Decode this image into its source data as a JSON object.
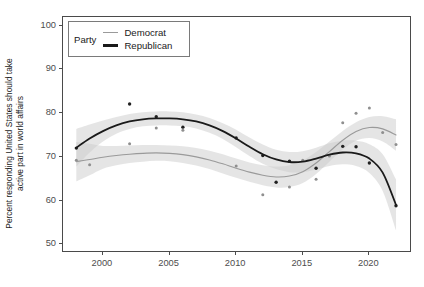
{
  "chart_data": {
    "type": "line",
    "title": "",
    "xlabel": "",
    "ylabel_line1": "Percent responding United States should take",
    "ylabel_line2": "active part in world affairs",
    "xlim": [
      1997.0,
      2023.2
    ],
    "ylim": [
      48.0,
      102.0
    ],
    "grid": false,
    "legend_position": "top-left-inside",
    "legend_title": "Party",
    "x_ticks": [
      2000,
      2005,
      2010,
      2015,
      2020
    ],
    "y_ticks": [
      50,
      60,
      70,
      80,
      90,
      100
    ],
    "colors": {
      "democrat_line": "#9a9a9a",
      "republican_line": "#1a1a1a",
      "democrat_band": "#cccccc",
      "republican_band": "#c4c4c4",
      "panel_border": "#4a4a4a",
      "tick_text": "#4d4d4d"
    },
    "series": [
      {
        "name": "Democrat",
        "color": "#9a9a9a",
        "smooth_x": [
          1998,
          1999,
          2000,
          2001,
          2002,
          2003,
          2004,
          2005,
          2006,
          2007,
          2008,
          2009,
          2010,
          2011,
          2012,
          2013,
          2014,
          2015,
          2016,
          2017,
          2018,
          2019,
          2020,
          2021,
          2022
        ],
        "smooth_y": [
          68.9,
          69.4,
          69.9,
          70.3,
          70.6,
          70.8,
          70.9,
          70.8,
          70.5,
          70.0,
          69.3,
          68.4,
          67.4,
          66.5,
          65.8,
          65.4,
          65.6,
          66.6,
          68.6,
          71.2,
          73.8,
          75.8,
          76.7,
          76.4,
          75.0
        ],
        "band_upper": [
          73.4,
          73.0,
          72.5,
          72.5,
          72.6,
          72.7,
          72.7,
          72.6,
          72.4,
          72.0,
          71.4,
          70.6,
          69.6,
          68.7,
          68.1,
          67.8,
          68.1,
          69.2,
          71.1,
          73.5,
          75.9,
          77.9,
          79.1,
          79.3,
          78.6
        ],
        "band_lower": [
          64.4,
          65.8,
          67.3,
          68.1,
          68.6,
          68.9,
          69.1,
          69.0,
          68.6,
          68.0,
          67.2,
          66.2,
          65.2,
          64.3,
          63.5,
          63.0,
          63.1,
          64.0,
          66.1,
          68.9,
          71.7,
          73.7,
          74.3,
          73.5,
          71.4
        ],
        "points_x": [
          1998,
          1999,
          2002,
          2004,
          2006,
          2010,
          2012,
          2014,
          2015,
          2016,
          2017,
          2018,
          2019,
          2020,
          2021,
          2022
        ],
        "points_y": [
          69.2,
          68.2,
          73.0,
          76.6,
          76.1,
          67.9,
          61.3,
          63.1,
          69.2,
          64.9,
          70.2,
          77.8,
          80.0,
          81.2,
          75.6,
          72.8
        ]
      },
      {
        "name": "Republican",
        "color": "#1a1a1a",
        "smooth_x": [
          1998,
          1999,
          2000,
          2001,
          2002,
          2003,
          2004,
          2005,
          2006,
          2007,
          2008,
          2009,
          2010,
          2011,
          2012,
          2013,
          2014,
          2015,
          2016,
          2017,
          2018,
          2019,
          2020,
          2021,
          2022
        ],
        "smooth_y": [
          72.1,
          74.2,
          75.9,
          77.2,
          78.1,
          78.6,
          78.8,
          78.8,
          78.6,
          78.1,
          77.2,
          75.9,
          74.2,
          72.3,
          70.6,
          69.4,
          68.8,
          68.9,
          69.6,
          70.5,
          71.0,
          70.8,
          69.6,
          66.4,
          59.0
        ],
        "band_upper": [
          76.4,
          77.4,
          78.3,
          79.1,
          79.8,
          80.2,
          80.4,
          80.4,
          80.2,
          79.7,
          78.9,
          77.7,
          76.2,
          74.4,
          72.8,
          71.6,
          71.1,
          71.3,
          72.1,
          73.1,
          73.7,
          73.7,
          72.9,
          70.6,
          64.8
        ],
        "band_lower": [
          67.8,
          71.0,
          73.5,
          75.3,
          76.4,
          77.0,
          77.2,
          77.2,
          77.0,
          76.5,
          75.5,
          74.1,
          72.2,
          70.2,
          68.4,
          67.2,
          66.5,
          66.5,
          67.1,
          67.9,
          68.3,
          67.9,
          66.3,
          62.2,
          53.2
        ]
      }
    ]
  }
}
